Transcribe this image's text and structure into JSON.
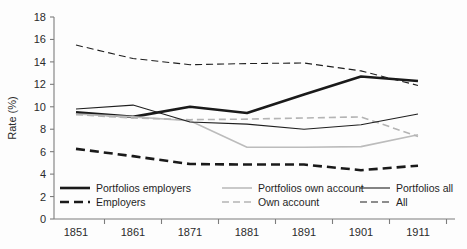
{
  "chart_data": {
    "type": "line",
    "title": "",
    "xlabel": "",
    "ylabel": "Rate (%)",
    "ylim": [
      0,
      18
    ],
    "ytick_step": 2,
    "yticks": [
      0,
      2,
      4,
      6,
      8,
      10,
      12,
      14,
      16,
      18
    ],
    "categories": [
      1851,
      1861,
      1871,
      1881,
      1891,
      1901,
      1911
    ],
    "x": [
      "1851",
      "1861",
      "1871",
      "1881",
      "1891",
      "1901",
      "1911"
    ],
    "grid": false,
    "legend_position": "inside-bottom",
    "series": [
      {
        "name": "Portfolios employers",
        "style": "solid",
        "color": "#1a1a1a",
        "width": 2.6,
        "values": [
          9.5,
          9.1,
          10.0,
          9.45,
          11.1,
          12.7,
          12.3
        ]
      },
      {
        "name": "Employers",
        "style": "dashed",
        "color": "#1a1a1a",
        "width": 2.6,
        "values": [
          6.25,
          5.6,
          4.9,
          4.85,
          4.85,
          4.35,
          4.75
        ]
      },
      {
        "name": "Portfolios own account",
        "style": "solid",
        "color": "#bcbcbc",
        "width": 1.6,
        "values": [
          9.35,
          9.1,
          8.75,
          6.4,
          6.4,
          6.45,
          7.5
        ]
      },
      {
        "name": "Own account",
        "style": "dashed",
        "color": "#b4b4b4",
        "width": 1.6,
        "values": [
          9.3,
          9.0,
          8.85,
          8.9,
          9.0,
          9.1,
          7.35
        ]
      },
      {
        "name": "Portfolios all",
        "style": "solid",
        "color": "#1f1f1f",
        "width": 1.1,
        "values": [
          9.8,
          10.15,
          8.65,
          8.45,
          8.0,
          8.4,
          9.35
        ]
      },
      {
        "name": "All",
        "style": "dashed",
        "color": "#1f1f1f",
        "width": 1.1,
        "values": [
          15.5,
          14.3,
          13.75,
          13.85,
          13.9,
          13.2,
          11.9
        ]
      }
    ]
  },
  "legend": {
    "entries": [
      {
        "label": "Portfolios employers",
        "series": "Portfolios employers",
        "col": 0,
        "row": 0
      },
      {
        "label": "Employers",
        "series": "Employers",
        "col": 0,
        "row": 1
      },
      {
        "label": "Portfolios own account",
        "series": "Portfolios own account",
        "col": 1,
        "row": 0
      },
      {
        "label": "Own account",
        "series": "Own account",
        "col": 1,
        "row": 1
      },
      {
        "label": "Portfolios all",
        "series": "Portfolios all",
        "col": 2,
        "row": 0
      },
      {
        "label": "All",
        "series": "All",
        "col": 2,
        "row": 1
      }
    ]
  },
  "colors": {
    "axis": "#7d7d7d",
    "text": "#2b2b2b",
    "background": "#fdfdfd",
    "dark_series": "#1a1a1a",
    "light_series": "#bcbcbc"
  }
}
